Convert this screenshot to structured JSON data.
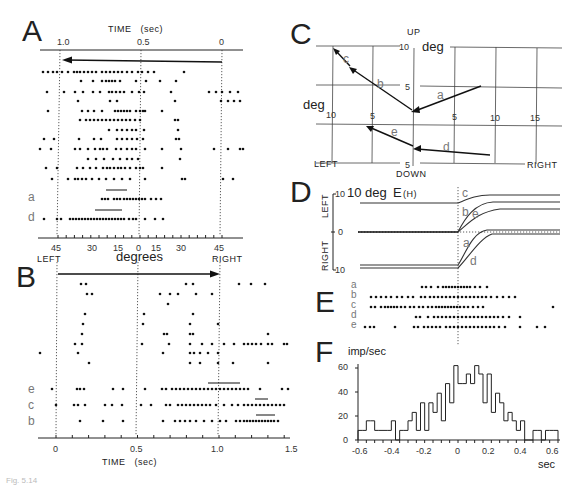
{
  "figure": {
    "panels": {
      "A": {
        "letter": "A",
        "top_axis_title": "TIME   (sec)",
        "top_ticks": [
          "1.0",
          "0.5",
          "0"
        ],
        "bottom_ticks": [
          "45",
          "30",
          "15",
          "0",
          "15",
          "30",
          "45"
        ],
        "bottom_left_label": "LEFT",
        "bottom_center_label": "degrees",
        "bottom_right_label": "RIGHT",
        "trial_labels": [
          "a",
          "d"
        ]
      },
      "B": {
        "letter": "B",
        "bottom_ticks": [
          "0",
          "0.5",
          "1.0",
          "1.5"
        ],
        "bottom_axis_title": "TIME   (sec)",
        "trial_labels": [
          "e",
          "c",
          "b"
        ]
      },
      "C": {
        "letter": "C",
        "up_label": "UP",
        "down_label": "DOWN",
        "left_label": "LEFT",
        "right_label": "RIGHT",
        "deg_vertical": "deg",
        "deg_horizontal": "deg",
        "v_ticks": [
          "10",
          "5",
          "5"
        ],
        "h_ticks": [
          "10",
          "5",
          "5",
          "10",
          "15"
        ],
        "vector_labels": [
          "a",
          "b",
          "c",
          "d",
          "e"
        ]
      },
      "D": {
        "letter": "D",
        "title": "10 deg",
        "trace_label": "E",
        "trace_sub": "(H)",
        "left_label": "LEFT",
        "right_label": "RIGHT",
        "ticks": [
          "10",
          "0",
          "10"
        ],
        "curve_labels": [
          "c",
          "b",
          "e",
          "a",
          "d"
        ]
      },
      "E": {
        "letter": "E",
        "row_labels": [
          "a",
          "b",
          "c",
          "d",
          "e"
        ]
      },
      "F": {
        "letter": "F",
        "ylabel": "imp/sec",
        "xlabel": "sec",
        "y_ticks": [
          "0",
          "20",
          "40",
          "60"
        ],
        "x_ticks": [
          "-0.6",
          "-0.4",
          "-0.2",
          "0",
          "0.2",
          "0.4",
          "0.6"
        ]
      }
    },
    "caption": "Fig. 5.14"
  },
  "chart_data": [
    {
      "type": "scatter",
      "title": "A: spike raster, leftward saccade trials",
      "xlabel": "TIME (sec) / degrees",
      "x_top_ticks": [
        1.0,
        0.5,
        0
      ],
      "x_bottom_ticks": [
        45,
        30,
        15,
        0,
        15,
        30,
        45
      ],
      "rows": 15
    },
    {
      "type": "scatter",
      "title": "B: spike raster, rightward target trials",
      "xlabel": "TIME (sec)",
      "x_ticks": [
        0,
        0.5,
        1.0,
        1.5
      ],
      "rows": 12
    },
    {
      "type": "line",
      "title": "C: saccade vectors",
      "xlabel": "deg (LEFT/RIGHT)",
      "ylabel": "deg (UP/DOWN)",
      "vectors": [
        {
          "name": "a",
          "from": [
            8.5,
            5
          ],
          "to": [
            0,
            2
          ]
        },
        {
          "name": "b",
          "from": [
            0,
            2
          ],
          "to": [
            -7.5,
            7.5
          ]
        },
        {
          "name": "c",
          "from": [
            -7.5,
            7.5
          ],
          "to": [
            -10,
            10
          ]
        },
        {
          "name": "d",
          "from": [
            9.5,
            -3.8
          ],
          "to": [
            0,
            -3
          ]
        },
        {
          "name": "e",
          "from": [
            0,
            -3
          ],
          "to": [
            -5.5,
            -0.2
          ]
        }
      ],
      "xlim": [
        -12,
        18
      ],
      "ylim": [
        -5,
        10
      ]
    },
    {
      "type": "line",
      "title": "D: horizontal eye position E(H)",
      "ylabel": "deg",
      "series": [
        {
          "name": "c",
          "start": 8,
          "end": 10
        },
        {
          "name": "b",
          "start": 0,
          "end": 8
        },
        {
          "name": "e",
          "start": 0,
          "end": 6
        },
        {
          "name": "a",
          "start": -8,
          "end": 0
        },
        {
          "name": "d",
          "start": -9,
          "end": -1
        }
      ],
      "ylim": [
        -10,
        10
      ]
    },
    {
      "type": "scatter",
      "title": "E: spike rasters aligned on saccade onset",
      "rows": [
        "a",
        "b",
        "c",
        "d",
        "e"
      ]
    },
    {
      "type": "bar",
      "title": "F: peri-saccadic histogram",
      "xlabel": "sec",
      "ylabel": "imp/sec",
      "xlim": [
        -0.6,
        0.6
      ],
      "ylim": [
        0,
        65
      ],
      "bin_width": 0.025,
      "bin_starts": [
        -0.6,
        -0.575,
        -0.55,
        -0.525,
        -0.5,
        -0.475,
        -0.45,
        -0.425,
        -0.4,
        -0.375,
        -0.35,
        -0.325,
        -0.3,
        -0.275,
        -0.25,
        -0.225,
        -0.2,
        -0.175,
        -0.15,
        -0.125,
        -0.1,
        -0.075,
        -0.05,
        -0.025,
        0,
        0.025,
        0.05,
        0.075,
        0.1,
        0.125,
        0.15,
        0.175,
        0.2,
        0.225,
        0.25,
        0.275,
        0.3,
        0.325,
        0.35,
        0.375,
        0.4,
        0.425,
        0.45,
        0.475,
        0.5,
        0.525,
        0.55,
        0.575
      ],
      "values": [
        8,
        8,
        16,
        16,
        8,
        8,
        8,
        8,
        16,
        0,
        8,
        8,
        16,
        23,
        8,
        31,
        8,
        31,
        23,
        39,
        16,
        47,
        31,
        62,
        47,
        47,
        55,
        47,
        62,
        55,
        31,
        55,
        23,
        39,
        31,
        16,
        23,
        16,
        8,
        16,
        0,
        0,
        8,
        8,
        0,
        8,
        8,
        8
      ]
    }
  ]
}
